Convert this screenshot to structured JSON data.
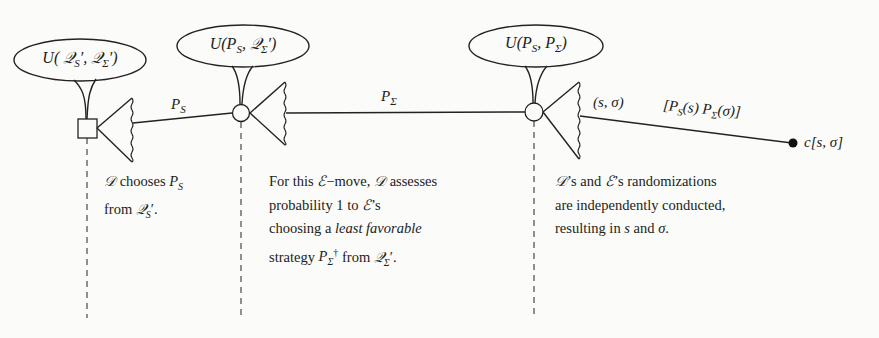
{
  "diagram": {
    "nodes": [
      {
        "id": "decision-node-1",
        "shape": "square",
        "utility_label": "U(𝒬_S′, 𝒬_Σ′)"
      },
      {
        "id": "chance-node-2",
        "shape": "circle",
        "utility_label": "U(P_S, 𝒬_Σ′)"
      },
      {
        "id": "chance-node-3",
        "shape": "circle",
        "utility_label": "U(P_S, P_Σ)"
      },
      {
        "id": "terminal-node",
        "shape": "dot",
        "label": "c[s, σ]"
      }
    ],
    "bubbles": {
      "b1": "U( 𝒬S′, 𝒬Σ′)",
      "b2": "U(PS, 𝒬Σ′)",
      "b3": "U(PS, PΣ)"
    },
    "edges": {
      "e1_label": "PS",
      "e2_label": "PΣ",
      "e3_label_left": "(s, σ)",
      "e3_label_right": "[PS(s) PΣ(σ)]"
    },
    "terminal_label": "c[s, σ]",
    "captions": {
      "c1": {
        "line1": "𝒟 chooses PS",
        "line2": "from  𝒬S′."
      },
      "c2": {
        "line1": "For this ℰ−move, 𝒟 assesses",
        "line2": "probability 1 to ℰ’s",
        "line3_pre": "choosing a ",
        "line3_em": "least favorable",
        "line4": "strategy PΣ† from  𝒬Σ′."
      },
      "c3": {
        "line1": "𝒟’s and ℰ’s randomizations",
        "line2": "are independently conducted,",
        "line3": "resulting in s and σ."
      }
    },
    "colors": {
      "ink": "#222222",
      "background": "#fbfbf9"
    }
  }
}
